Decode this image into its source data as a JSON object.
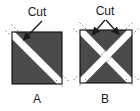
{
  "figure": {
    "title_text": "",
    "background_color": "#ffffff",
    "shape_fill_color": "#4a4a4a",
    "shape_outline_color": "#222222",
    "cut_band_color": "#ffffff",
    "cut_band_dash_color": "#5a5a5a",
    "leader_line_color": "#1a1a1a",
    "text_color": "#1a1a1a"
  },
  "panels": [
    {
      "id": "A",
      "letter": "A",
      "cut_label": "Cut",
      "cut_count": 1,
      "description": "square with one diagonal cut",
      "pieces": 2,
      "arrows": 1
    },
    {
      "id": "B",
      "letter": "B",
      "cut_label": "Cut",
      "cut_count": 2,
      "description": "square with two diagonal cuts forming an X",
      "pieces": 4,
      "arrows": 2
    }
  ]
}
